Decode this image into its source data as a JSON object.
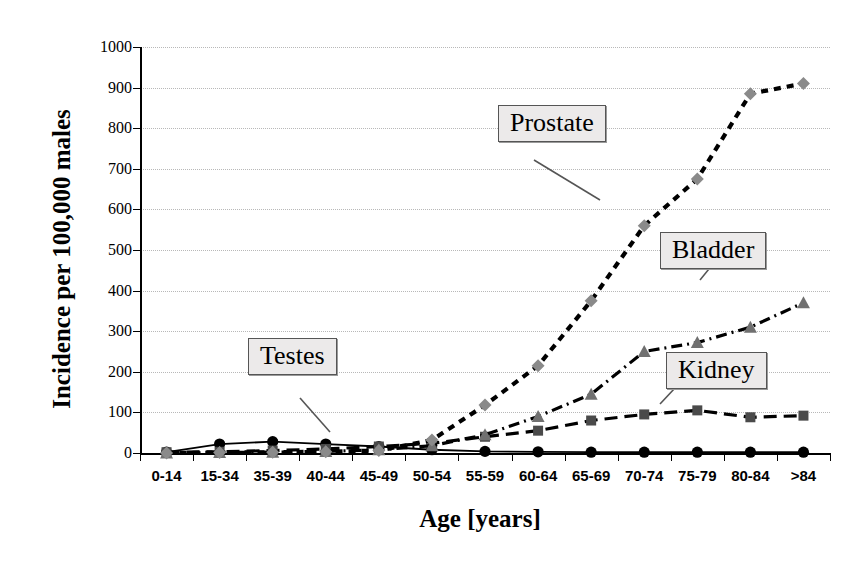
{
  "chart_data": {
    "type": "line",
    "title": "",
    "xlabel": "Age [years]",
    "ylabel": "Incidence per 100,000 males",
    "categories": [
      "0-14",
      "15-34",
      "35-39",
      "40-44",
      "45-49",
      "50-54",
      "55-59",
      "60-64",
      "65-69",
      "70-74",
      "75-79",
      "80-84",
      ">84"
    ],
    "ylim": [
      0,
      1000
    ],
    "yticks": [
      0,
      100,
      200,
      300,
      400,
      500,
      600,
      700,
      800,
      900,
      1000
    ],
    "grid": true,
    "legend": "inline-callout-labels",
    "series": [
      {
        "name": "Testes",
        "marker": "circle",
        "color": "#000000",
        "linestyle": "solid",
        "values": [
          2,
          22,
          28,
          22,
          16,
          8,
          4,
          3,
          2,
          2,
          2,
          2,
          2
        ]
      },
      {
        "name": "Kidney",
        "marker": "square",
        "color": "#000000",
        "linestyle": "dashed",
        "values": [
          2,
          3,
          6,
          10,
          16,
          24,
          40,
          55,
          80,
          95,
          105,
          88,
          92
        ]
      },
      {
        "name": "Bladder",
        "marker": "triangle",
        "color": "#000000",
        "linestyle": "dash-dot",
        "values": [
          0,
          1,
          2,
          4,
          8,
          18,
          45,
          90,
          145,
          250,
          272,
          310,
          370
        ]
      },
      {
        "name": "Prostate",
        "marker": "diamond",
        "color": "#000000",
        "linestyle": "dotted-heavy",
        "values": [
          0,
          1,
          2,
          3,
          6,
          32,
          118,
          215,
          375,
          560,
          675,
          885,
          910
        ]
      }
    ]
  },
  "labels": {
    "testes": "Testes",
    "prostate": "Prostate",
    "bladder": "Bladder",
    "kidney": "Kidney"
  }
}
